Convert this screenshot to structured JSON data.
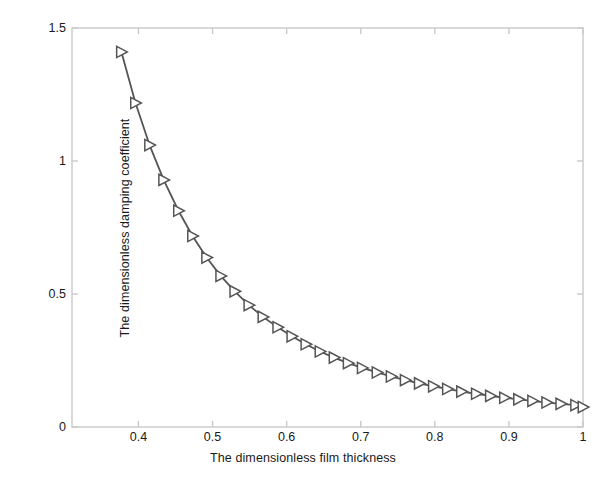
{
  "chart_data": {
    "type": "line",
    "title": "",
    "xlabel": "The dimensionless film thickness",
    "ylabel": "The dimensionless damping coefficient",
    "xlim": [
      0.3103,
      1.0
    ],
    "ylim": [
      0.0,
      1.5
    ],
    "xticks": [
      0.4,
      0.5,
      0.6,
      0.7,
      0.8,
      0.9,
      1
    ],
    "xticklabels": [
      "0.4",
      "0.5",
      "0.6",
      "0.7",
      "0.8",
      "0.9",
      "1"
    ],
    "yticks": [
      0,
      0.5,
      1,
      1.5
    ],
    "yticklabels": [
      "0",
      "0.5",
      "1",
      "1.5"
    ],
    "grid": false,
    "legend": null,
    "marker": "right-triangle-open",
    "line_color": "#555555",
    "marker_color": "#555555",
    "marker_face": "#ffffff",
    "axes_color": "#c9c9c9",
    "series": [
      {
        "name": "dimensionless damping coefficient",
        "x": [
          0.377,
          0.396,
          0.415,
          0.434,
          0.454,
          0.473,
          0.492,
          0.511,
          0.53,
          0.549,
          0.568,
          0.588,
          0.607,
          0.626,
          0.645,
          0.664,
          0.683,
          0.702,
          0.722,
          0.741,
          0.76,
          0.779,
          0.798,
          0.817,
          0.836,
          0.856,
          0.875,
          0.894,
          0.913,
          0.932,
          0.951,
          0.97,
          0.99,
          1.0
        ],
        "y": [
          1.41,
          1.218,
          1.06,
          0.929,
          0.813,
          0.718,
          0.637,
          0.568,
          0.51,
          0.458,
          0.414,
          0.375,
          0.341,
          0.311,
          0.284,
          0.261,
          0.24,
          0.222,
          0.205,
          0.19,
          0.176,
          0.164,
          0.153,
          0.143,
          0.133,
          0.125,
          0.117,
          0.11,
          0.104,
          0.098,
          0.092,
          0.087,
          0.082,
          0.075
        ]
      }
    ],
    "relation_note": "approximately inverse-cubic decay"
  },
  "axis": {
    "x_label": "The dimensionless film thickness",
    "y_label": "The dimensionless damping coefficient"
  }
}
